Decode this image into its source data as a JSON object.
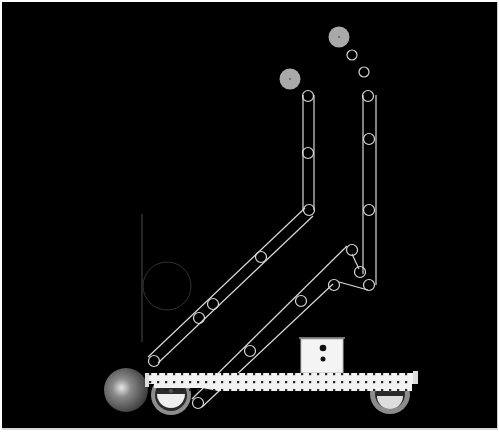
{
  "scene": {
    "type": "robot-simulation-viewport",
    "background": "#000000",
    "colors": {
      "outline": "#d9d9d9",
      "ball_game_piece": "#a9a9a9",
      "chassis": "#f2f2f2",
      "wheel": "#8c8c8c",
      "bumper_sphere": "#6e6e6e",
      "faint_guide": "#3a3a3a"
    },
    "objects": {
      "balls_in_air": 2,
      "small_rollers_top": 2,
      "left_vertical_conveyor_rollers": 3,
      "right_vertical_conveyor_rollers": 3,
      "diagonal_conveyor_rollers": 4,
      "wheels": 2,
      "control_box": 1
    }
  }
}
